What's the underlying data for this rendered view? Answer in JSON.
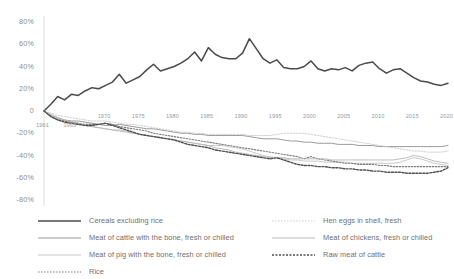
{
  "chart_data": {
    "type": "line",
    "title": "",
    "xlabel": "",
    "ylabel": "",
    "ylim": [
      -80,
      80
    ],
    "xlim": [
      1961,
      2020
    ],
    "grid": false,
    "legend_position": "bottom",
    "y_ticks": [
      "80%",
      "60%",
      "40%",
      "20%",
      "0",
      "-20%",
      "-40%",
      "-60%",
      "-80%"
    ],
    "y_tick_values": [
      80,
      60,
      40,
      20,
      0,
      -20,
      -40,
      -60,
      -80
    ],
    "x_ticks": [
      "1961",
      "1965",
      "1970",
      "1975",
      "1980",
      "1985",
      "1990",
      "1995",
      "2000",
      "2005",
      "2010",
      "2015",
      "2020"
    ],
    "x_tick_values": [
      1961,
      1965,
      1970,
      1975,
      1980,
      1985,
      1990,
      1995,
      2000,
      2005,
      2010,
      2015,
      2020
    ],
    "x": [
      1961,
      1962,
      1963,
      1964,
      1965,
      1966,
      1967,
      1968,
      1969,
      1970,
      1971,
      1972,
      1973,
      1974,
      1975,
      1976,
      1977,
      1978,
      1979,
      1980,
      1981,
      1982,
      1983,
      1984,
      1985,
      1986,
      1987,
      1988,
      1989,
      1990,
      1991,
      1992,
      1993,
      1994,
      1995,
      1996,
      1997,
      1998,
      1999,
      2000,
      2001,
      2002,
      2003,
      2004,
      2005,
      2006,
      2007,
      2008,
      2009,
      2010,
      2011,
      2012,
      2013,
      2014,
      2015,
      2016,
      2017,
      2018,
      2019,
      2020
    ],
    "series": [
      {
        "name": "Cereals excluding rice",
        "color": "#4a4a4a",
        "width": 1.5,
        "dash": "none",
        "values": [
          0,
          6,
          13,
          10,
          15,
          14,
          18,
          21,
          20,
          23,
          26,
          33,
          25,
          28,
          31,
          37,
          42,
          36,
          38,
          40,
          43,
          47,
          53,
          45,
          57,
          51,
          48,
          47,
          47,
          52,
          65,
          56,
          47,
          43,
          46,
          39,
          38,
          38,
          40,
          45,
          38,
          36,
          38,
          37,
          39,
          36,
          41,
          43,
          44,
          38,
          34,
          37,
          38,
          34,
          30,
          27,
          26,
          24,
          23,
          25
        ]
      },
      {
        "name": "Meat of cattle with the bone, fresh or chilled",
        "color": "#8f8f8f",
        "width": 0.9,
        "dash": "none",
        "values": [
          0,
          -4,
          -6,
          -8,
          -9,
          -9,
          -10,
          -11,
          -12,
          -13,
          -13,
          -12,
          -13,
          -14,
          -15,
          -16,
          -16,
          -17,
          -18,
          -19,
          -20,
          -20,
          -21,
          -21,
          -22,
          -22,
          -22,
          -22,
          -22,
          -22,
          -23,
          -24,
          -25,
          -25,
          -25,
          -26,
          -27,
          -27,
          -28,
          -28,
          -29,
          -29,
          -29,
          -30,
          -30,
          -30,
          -31,
          -31,
          -31,
          -32,
          -32,
          -32,
          -32,
          -32,
          -32,
          -32,
          -32,
          -32,
          -32,
          -31
        ]
      },
      {
        "name": "Meat of pig with the bone, fresh or chilled",
        "color": "#c2c2c2",
        "width": 0.9,
        "dash": "none",
        "values": [
          0,
          -4,
          -7,
          -9,
          -11,
          -12,
          -13,
          -14,
          -15,
          -16,
          -17,
          -17,
          -18,
          -19,
          -21,
          -22,
          -23,
          -24,
          -25,
          -26,
          -27,
          -28,
          -29,
          -30,
          -31,
          -31,
          -31,
          -32,
          -33,
          -34,
          -36,
          -38,
          -40,
          -41,
          -42,
          -43,
          -44,
          -44,
          -45,
          -45,
          -45,
          -46,
          -46,
          -46,
          -46,
          -47,
          -47,
          -47,
          -47,
          -47,
          -47,
          -47,
          -46,
          -44,
          -42,
          -43,
          -45,
          -47,
          -48,
          -49
        ]
      },
      {
        "name": "Rice",
        "color": "#7d7d7d",
        "width": 1.1,
        "dash": "1.5,1.5",
        "values": [
          0,
          -5,
          -8,
          -9,
          -10,
          -11,
          -12,
          -12,
          -12,
          -11,
          -12,
          -14,
          -15,
          -16,
          -17,
          -18,
          -20,
          -21,
          -22,
          -23,
          -24,
          -25,
          -26,
          -27,
          -28,
          -29,
          -30,
          -31,
          -32,
          -33,
          -34,
          -35,
          -36,
          -37,
          -38,
          -39,
          -40,
          -41,
          -43,
          -41,
          -43,
          -44,
          -45,
          -46,
          -47,
          -47,
          -48,
          -48,
          -48,
          -49,
          -49,
          -50,
          -50,
          -50,
          -50,
          -50,
          -50,
          -50,
          -50,
          -50
        ]
      },
      {
        "name": "Hen eggs in shell, fresh",
        "color": "#c8c8c8",
        "width": 0.9,
        "dash": "1.5,1.5",
        "values": [
          0,
          -2,
          -4,
          -5,
          -6,
          -7,
          -8,
          -9,
          -9,
          -9,
          -10,
          -11,
          -12,
          -12,
          -13,
          -14,
          -15,
          -16,
          -17,
          -18,
          -19,
          -19,
          -20,
          -20,
          -21,
          -21,
          -21,
          -21,
          -21,
          -21,
          -22,
          -22,
          -22,
          -22,
          -21,
          -20,
          -20,
          -20,
          -20,
          -21,
          -22,
          -23,
          -24,
          -25,
          -26,
          -27,
          -28,
          -29,
          -30,
          -31,
          -32,
          -33,
          -34,
          -35,
          -36,
          -36,
          -37,
          -37,
          -37,
          -36
        ]
      },
      {
        "name": "Meat of chickens, fresh or chilled",
        "color": "#b5b5b5",
        "width": 0.9,
        "dash": "none",
        "values": [
          0,
          -3,
          -6,
          -8,
          -10,
          -11,
          -13,
          -14,
          -15,
          -16,
          -17,
          -18,
          -19,
          -20,
          -21,
          -22,
          -23,
          -24,
          -25,
          -26,
          -27,
          -28,
          -29,
          -30,
          -31,
          -33,
          -34,
          -35,
          -37,
          -38,
          -39,
          -40,
          -41,
          -42,
          -42,
          -42,
          -43,
          -43,
          -43,
          -43,
          -43,
          -43,
          -44,
          -44,
          -44,
          -44,
          -44,
          -44,
          -44,
          -44,
          -44,
          -44,
          -43,
          -42,
          -40,
          -41,
          -43,
          -45,
          -46,
          -47
        ]
      },
      {
        "name": "Raw meat of cattle",
        "color": "#4f4f4f",
        "width": 1.4,
        "dash": "2,1.5",
        "values": [
          0,
          -5,
          -8,
          -10,
          -11,
          -12,
          -13,
          -13,
          -12,
          -11,
          -13,
          -15,
          -17,
          -19,
          -21,
          -22,
          -23,
          -24,
          -25,
          -26,
          -28,
          -30,
          -31,
          -32,
          -33,
          -35,
          -36,
          -37,
          -38,
          -39,
          -40,
          -41,
          -42,
          -43,
          -42,
          -44,
          -46,
          -48,
          -49,
          -49,
          -50,
          -50,
          -51,
          -51,
          -52,
          -52,
          -53,
          -53,
          -54,
          -54,
          -55,
          -55,
          -55,
          -56,
          -56,
          -56,
          -56,
          -55,
          -54,
          -51
        ]
      }
    ]
  },
  "legend": {
    "items": [
      {
        "label": "Cereals excluding rice",
        "column": "left"
      },
      {
        "label": "Meat of cattle with the bone, fresh or chilled",
        "column": "left"
      },
      {
        "label": "Meat of pig with the bone, fresh or chilled",
        "column": "left"
      },
      {
        "label": "Rice",
        "column": "left"
      },
      {
        "label": "Hen eggs in shell, fresh",
        "column": "right"
      },
      {
        "label": "Meat of chickens, fresh or chilled",
        "column": "right"
      },
      {
        "label": "Raw meat of cattle",
        "column": "right"
      }
    ]
  }
}
